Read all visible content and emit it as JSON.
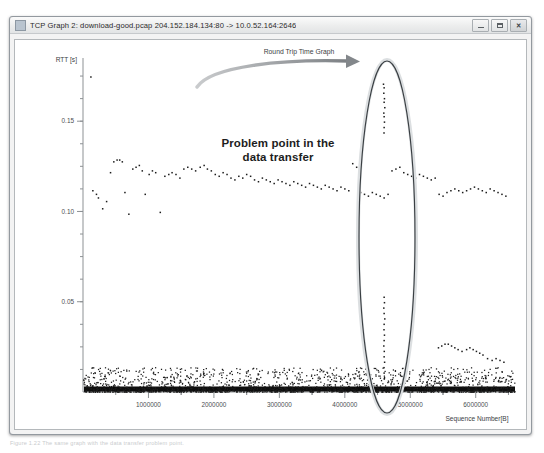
{
  "window": {
    "title": "TCP Graph 2: download-good.pcap 204.152.184.134:80 -> 10.0.52.164:2646",
    "icon": "app-graph-icon",
    "controls": {
      "minimize_label": "–",
      "maximize_label": "□",
      "close_label": "✕"
    }
  },
  "annotation": {
    "line1": "Problem point in the",
    "line2": "data transfer",
    "arrow": "curved-arrow-right",
    "ellipse": "highlight-ellipse"
  },
  "caption": {
    "text": "Figure 1.22  The same graph with the data transfer problem point."
  },
  "chart_data": {
    "type": "scatter",
    "title": "Round Trip Time Graph",
    "xlabel": "Sequence Number[B]",
    "ylabel": "RTT [s]",
    "xlim": [
      0,
      6600000
    ],
    "ylim": [
      0,
      0.185
    ],
    "xticks": [
      1000000,
      2000000,
      3000000,
      4000000,
      5000000,
      6000000
    ],
    "xticklabels": [
      "1000000",
      "2000000",
      "3000000",
      "4000000",
      "5000000",
      "6000000"
    ],
    "yticks": [
      0.05,
      0.1,
      0.15
    ],
    "yticklabels": [
      "0.05",
      "0.10",
      "0.15"
    ],
    "yminor_step": 0.0125,
    "grid": false,
    "legend": null,
    "series": [
      {
        "name": "RTT samples (upper band ~0.10-0.13 s)",
        "points": [
          [
            120000,
            0.1745
          ],
          [
            150000,
            0.1115
          ],
          [
            205000,
            0.1095
          ],
          [
            235000,
            0.1075
          ],
          [
            300000,
            0.1015
          ],
          [
            360000,
            0.1055
          ],
          [
            420000,
            0.1215
          ],
          [
            470000,
            0.1275
          ],
          [
            520000,
            0.1285
          ],
          [
            560000,
            0.1285
          ],
          [
            600000,
            0.1275
          ],
          [
            640000,
            0.1105
          ],
          [
            700000,
            0.0985
          ],
          [
            760000,
            0.1235
          ],
          [
            810000,
            0.1245
          ],
          [
            860000,
            0.1255
          ],
          [
            905000,
            0.1225
          ],
          [
            950000,
            0.1095
          ],
          [
            1010000,
            0.1205
          ],
          [
            1060000,
            0.1225
          ],
          [
            1110000,
            0.1215
          ],
          [
            1180000,
            0.0995
          ],
          [
            1250000,
            0.1195
          ],
          [
            1310000,
            0.1205
          ],
          [
            1360000,
            0.1215
          ],
          [
            1420000,
            0.1205
          ],
          [
            1480000,
            0.1185
          ],
          [
            1540000,
            0.1235
          ],
          [
            1600000,
            0.1245
          ],
          [
            1660000,
            0.1235
          ],
          [
            1720000,
            0.1225
          ],
          [
            1790000,
            0.1245
          ],
          [
            1850000,
            0.1255
          ],
          [
            1900000,
            0.1235
          ],
          [
            1960000,
            0.1225
          ],
          [
            2020000,
            0.1205
          ],
          [
            2080000,
            0.1195
          ],
          [
            2140000,
            0.1215
          ],
          [
            2200000,
            0.1205
          ],
          [
            2260000,
            0.1185
          ],
          [
            2320000,
            0.1175
          ],
          [
            2380000,
            0.1195
          ],
          [
            2440000,
            0.1185
          ],
          [
            2500000,
            0.1205
          ],
          [
            2560000,
            0.1195
          ],
          [
            2620000,
            0.1175
          ],
          [
            2680000,
            0.1165
          ],
          [
            2740000,
            0.1185
          ],
          [
            2800000,
            0.1175
          ],
          [
            2860000,
            0.1165
          ],
          [
            2920000,
            0.1155
          ],
          [
            2980000,
            0.1175
          ],
          [
            3040000,
            0.1165
          ],
          [
            3100000,
            0.1155
          ],
          [
            3160000,
            0.1145
          ],
          [
            3220000,
            0.1165
          ],
          [
            3280000,
            0.1155
          ],
          [
            3340000,
            0.1145
          ],
          [
            3400000,
            0.1135
          ],
          [
            3460000,
            0.1155
          ],
          [
            3520000,
            0.1145
          ],
          [
            3580000,
            0.1135
          ],
          [
            3640000,
            0.1125
          ],
          [
            3700000,
            0.1145
          ],
          [
            3760000,
            0.1135
          ],
          [
            3820000,
            0.1125
          ],
          [
            3880000,
            0.1115
          ],
          [
            3940000,
            0.1135
          ],
          [
            4000000,
            0.1125
          ],
          [
            4060000,
            0.1115
          ],
          [
            4120000,
            0.1265
          ],
          [
            4180000,
            0.1245
          ],
          [
            4240000,
            0.1105
          ],
          [
            4300000,
            0.1095
          ],
          [
            4360000,
            0.1085
          ],
          [
            4420000,
            0.1105
          ],
          [
            4480000,
            0.1095
          ],
          [
            4540000,
            0.1085
          ],
          [
            4600000,
            0.1075
          ],
          [
            4660000,
            0.1095
          ],
          [
            4720000,
            0.1225
          ],
          [
            4780000,
            0.1235
          ],
          [
            4840000,
            0.1245
          ],
          [
            4900000,
            0.1215
          ],
          [
            4960000,
            0.1205
          ],
          [
            5020000,
            0.1195
          ],
          [
            5080000,
            0.1185
          ],
          [
            5140000,
            0.1205
          ],
          [
            5200000,
            0.1195
          ],
          [
            5260000,
            0.1185
          ],
          [
            5320000,
            0.1175
          ],
          [
            5380000,
            0.1185
          ],
          [
            5440000,
            0.1095
          ],
          [
            5500000,
            0.1085
          ],
          [
            5560000,
            0.1105
          ],
          [
            5620000,
            0.1115
          ],
          [
            5680000,
            0.1125
          ],
          [
            5740000,
            0.1115
          ],
          [
            5800000,
            0.1105
          ],
          [
            5860000,
            0.1115
          ],
          [
            5920000,
            0.1125
          ],
          [
            5980000,
            0.1135
          ],
          [
            6040000,
            0.1125
          ],
          [
            6100000,
            0.1115
          ],
          [
            6160000,
            0.1105
          ],
          [
            6220000,
            0.1125
          ],
          [
            6280000,
            0.1115
          ],
          [
            6340000,
            0.1105
          ],
          [
            6400000,
            0.1095
          ],
          [
            6460000,
            0.1085
          ]
        ]
      },
      {
        "name": "RTT samples (problem column ~x=4600000)",
        "points": [
          [
            4590000,
            0.1705
          ],
          [
            4600000,
            0.1685
          ],
          [
            4595000,
            0.1655
          ],
          [
            4605000,
            0.1625
          ],
          [
            4600000,
            0.1605
          ],
          [
            4610000,
            0.1575
          ],
          [
            4595000,
            0.1545
          ],
          [
            4600000,
            0.1525
          ],
          [
            4605000,
            0.1495
          ],
          [
            4600000,
            0.1465
          ],
          [
            4598000,
            0.1435
          ],
          [
            4600000,
            0.0525
          ],
          [
            4605000,
            0.0495
          ],
          [
            4595000,
            0.0465
          ],
          [
            4600000,
            0.0435
          ],
          [
            4610000,
            0.0405
          ],
          [
            4600000,
            0.0375
          ],
          [
            4598000,
            0.0345
          ],
          [
            4605000,
            0.0315
          ],
          [
            4600000,
            0.0285
          ],
          [
            4595000,
            0.0255
          ],
          [
            4602000,
            0.0225
          ],
          [
            4600000,
            0.0195
          ],
          [
            4607000,
            0.0165
          ],
          [
            4598000,
            0.0135
          ],
          [
            4600000,
            0.0105
          ],
          [
            4604000,
            0.0075
          ]
        ]
      },
      {
        "name": "RTT samples (low cluster right ~0.02 s)",
        "points": [
          [
            5430000,
            0.0245
          ],
          [
            5480000,
            0.0255
          ],
          [
            5530000,
            0.0265
          ],
          [
            5580000,
            0.0265
          ],
          [
            5630000,
            0.0255
          ],
          [
            5680000,
            0.0245
          ],
          [
            5730000,
            0.0235
          ],
          [
            5790000,
            0.0225
          ],
          [
            5860000,
            0.0235
          ],
          [
            5910000,
            0.0245
          ],
          [
            5960000,
            0.0235
          ],
          [
            6010000,
            0.0225
          ],
          [
            6060000,
            0.0215
          ],
          [
            6110000,
            0.0205
          ],
          [
            6180000,
            0.0185
          ],
          [
            6250000,
            0.0175
          ],
          [
            6310000,
            0.0185
          ],
          [
            6370000,
            0.0175
          ],
          [
            6430000,
            0.0165
          ]
        ]
      },
      {
        "name": "RTT samples (baseline band ~0 s, dense)",
        "description": "Dense near-zero RTT points spanning the full sequence range"
      }
    ]
  }
}
